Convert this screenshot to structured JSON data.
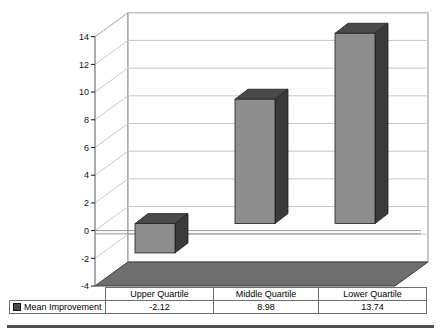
{
  "chart": {
    "background": "#ffffff",
    "wall_border_color": "#8f8f8f",
    "gridline_color": "#c6c6c6",
    "floor_color": "#6e6e6e",
    "floor_edge_color": "#3f3f3f",
    "bar_front_color": "#8e8e8e",
    "bar_top_color": "#4a4a4a",
    "bar_side_color": "#3a3a3a",
    "bar_edge_color": "#1f1f1f",
    "zero_line_color": "#8a8a8a",
    "tick_label_color": "#111111"
  },
  "chart_data": {
    "type": "bar",
    "subtype": "3d-column",
    "title": "",
    "categories": [
      "Upper Quartile",
      "Middle Quartile",
      "Lower Quartile"
    ],
    "series": [
      {
        "name": "Mean Improvement",
        "values": [
          -2.12,
          8.98,
          13.74
        ]
      }
    ],
    "ylim": [
      -4,
      14
    ],
    "ytick_step": 2,
    "yticks": [
      14,
      12,
      10,
      8,
      6,
      4,
      2,
      0,
      -2,
      -4
    ],
    "grid": true,
    "legend_position": "data-table-left",
    "data_table": true
  },
  "table": {
    "values_display": [
      "-2.12",
      "8.98",
      "13.74"
    ]
  }
}
